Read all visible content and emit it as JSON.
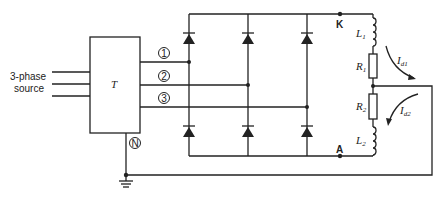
{
  "diagram": {
    "type": "circuit-schematic",
    "source_label_line1": "3-phase",
    "source_label_line2": "source",
    "transformer_label": "T",
    "phase_labels": [
      "1",
      "2",
      "3"
    ],
    "neutral_label": "N",
    "node_k_label": "K",
    "node_a_label": "A",
    "components": {
      "L1": {
        "symbol": "L",
        "sub": "1"
      },
      "R1": {
        "symbol": "R",
        "sub": "1"
      },
      "R2": {
        "symbol": "R",
        "sub": "2"
      },
      "L2": {
        "symbol": "L",
        "sub": "2"
      }
    },
    "currents": {
      "id1": {
        "symbol": "I",
        "sub": "d1"
      },
      "id2": {
        "symbol": "I",
        "sub": "d2"
      }
    },
    "diode_count": 6,
    "colors": {
      "line": "#222222",
      "background": "#ffffff"
    }
  }
}
